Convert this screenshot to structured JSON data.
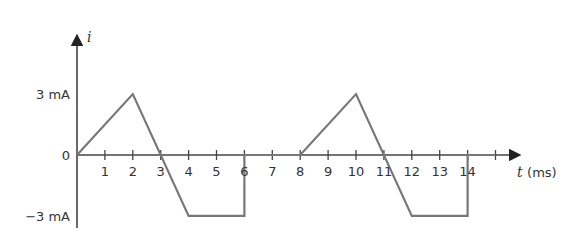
{
  "chart_data": {
    "type": "line",
    "title": "",
    "xlabel_var": "t",
    "xlabel_unit": "(ms)",
    "ylabel": "i",
    "x_ticks": [
      1,
      2,
      3,
      4,
      5,
      6,
      7,
      8,
      9,
      10,
      11,
      12,
      13,
      14
    ],
    "y_tick_labels": [
      {
        "value": 3,
        "label": "3 mA"
      },
      {
        "value": 0,
        "label": "0"
      },
      {
        "value": -3,
        "label": "−3 mA"
      }
    ],
    "xlim": [
      0,
      15.5
    ],
    "ylim": [
      -3,
      3
    ],
    "grid": false,
    "series": [
      {
        "name": "i(t)",
        "unit": "mA",
        "points": [
          [
            0,
            0
          ],
          [
            2,
            3
          ],
          [
            4,
            -3
          ],
          [
            6,
            -3
          ],
          [
            6,
            0
          ],
          [
            8,
            0
          ],
          [
            10,
            3
          ],
          [
            12,
            -3
          ],
          [
            14,
            -3
          ],
          [
            14,
            0
          ],
          [
            15,
            0
          ]
        ]
      }
    ]
  },
  "colors": {
    "axis": "#444444",
    "trace": "#777777",
    "text": "#333333"
  }
}
